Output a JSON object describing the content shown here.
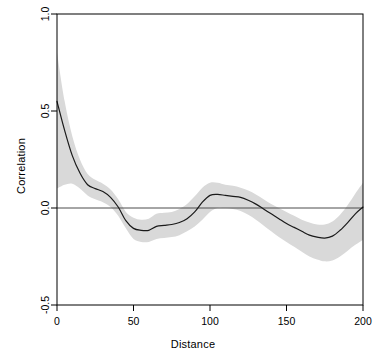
{
  "chart_data": {
    "type": "line",
    "title": "",
    "xlabel": "Distance",
    "ylabel": "Correlation",
    "xlim": [
      0,
      200
    ],
    "ylim": [
      -0.5,
      1.0
    ],
    "xticks": [
      0,
      50,
      100,
      150,
      200
    ],
    "xtick_labels": [
      "0",
      "50",
      "100",
      "150",
      "200"
    ],
    "yticks": [
      -0.5,
      0.0,
      0.5,
      1.0
    ],
    "ytick_labels": [
      "-0.5",
      "0.0",
      "0.5",
      "1.0"
    ],
    "grid": false,
    "legend": null,
    "reference_line": {
      "y": 0.0,
      "color": "#4d4d4d",
      "name": "zero-correlation-line"
    },
    "band_color": "#d9d9d9",
    "line_color": "#1a1a1a",
    "box_color": "#000000",
    "background": "#ffffff",
    "series": [
      {
        "name": "Correlation",
        "style": "smooth-spline",
        "x": [
          0,
          5,
          10,
          15,
          20,
          25,
          30,
          35,
          40,
          45,
          50,
          55,
          60,
          65,
          70,
          75,
          80,
          85,
          90,
          95,
          100,
          105,
          110,
          115,
          120,
          125,
          130,
          135,
          140,
          145,
          150,
          155,
          160,
          165,
          170,
          175,
          180,
          185,
          190,
          195,
          200
        ],
        "values": [
          0.55,
          0.4,
          0.27,
          0.18,
          0.12,
          0.1,
          0.085,
          0.055,
          0.005,
          -0.065,
          -0.105,
          -0.115,
          -0.115,
          -0.095,
          -0.09,
          -0.085,
          -0.075,
          -0.055,
          -0.02,
          0.03,
          0.065,
          0.07,
          0.065,
          0.06,
          0.055,
          0.04,
          0.02,
          -0.005,
          -0.03,
          -0.055,
          -0.08,
          -0.1,
          -0.12,
          -0.14,
          -0.15,
          -0.155,
          -0.145,
          -0.115,
          -0.075,
          -0.03,
          0.005
        ]
      },
      {
        "name": "Confidence band upper",
        "style": "band-upper",
        "x": [
          0,
          5,
          10,
          15,
          20,
          25,
          30,
          35,
          40,
          45,
          50,
          55,
          60,
          65,
          70,
          75,
          80,
          85,
          90,
          95,
          100,
          105,
          110,
          115,
          120,
          125,
          130,
          135,
          140,
          145,
          150,
          155,
          160,
          165,
          170,
          175,
          180,
          185,
          190,
          195,
          200
        ],
        "values": [
          0.8,
          0.55,
          0.37,
          0.25,
          0.175,
          0.145,
          0.125,
          0.095,
          0.045,
          -0.02,
          -0.05,
          -0.06,
          -0.055,
          -0.03,
          -0.025,
          -0.02,
          -0.005,
          0.02,
          0.06,
          0.105,
          0.13,
          0.13,
          0.12,
          0.115,
          0.105,
          0.09,
          0.07,
          0.045,
          0.02,
          0.0,
          -0.02,
          -0.04,
          -0.06,
          -0.075,
          -0.085,
          -0.085,
          -0.07,
          -0.035,
          0.015,
          0.075,
          0.13
        ]
      },
      {
        "name": "Confidence band lower",
        "style": "band-lower",
        "x": [
          0,
          5,
          10,
          15,
          20,
          25,
          30,
          35,
          40,
          45,
          50,
          55,
          60,
          65,
          70,
          75,
          80,
          85,
          90,
          95,
          100,
          105,
          110,
          115,
          120,
          125,
          130,
          135,
          140,
          145,
          150,
          155,
          160,
          165,
          170,
          175,
          180,
          185,
          190,
          195,
          200
        ],
        "values": [
          0.1,
          0.12,
          0.125,
          0.1,
          0.065,
          0.045,
          0.03,
          0.005,
          -0.04,
          -0.105,
          -0.16,
          -0.175,
          -0.175,
          -0.16,
          -0.155,
          -0.15,
          -0.14,
          -0.12,
          -0.095,
          -0.06,
          -0.02,
          0.0,
          0.0,
          -0.005,
          -0.015,
          -0.035,
          -0.06,
          -0.09,
          -0.12,
          -0.15,
          -0.175,
          -0.2,
          -0.225,
          -0.25,
          -0.265,
          -0.275,
          -0.27,
          -0.25,
          -0.22,
          -0.19,
          -0.165
        ]
      }
    ]
  },
  "labels": {
    "xaxis_title": "Distance",
    "yaxis_title": "Correlation"
  }
}
